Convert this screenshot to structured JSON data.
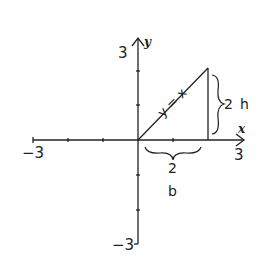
{
  "diagram": {
    "axes": {
      "x_label": "x",
      "y_label": "y",
      "x_min_label": "−3",
      "x_max_label": "3",
      "y_max_label": "3",
      "y_min_label": "−3"
    },
    "line_label": "y = x",
    "height_value": "2",
    "height_label": "h",
    "base_value": "2",
    "base_label": "b"
  },
  "colors": {
    "ink": "#222222",
    "background": "#ffffff"
  }
}
